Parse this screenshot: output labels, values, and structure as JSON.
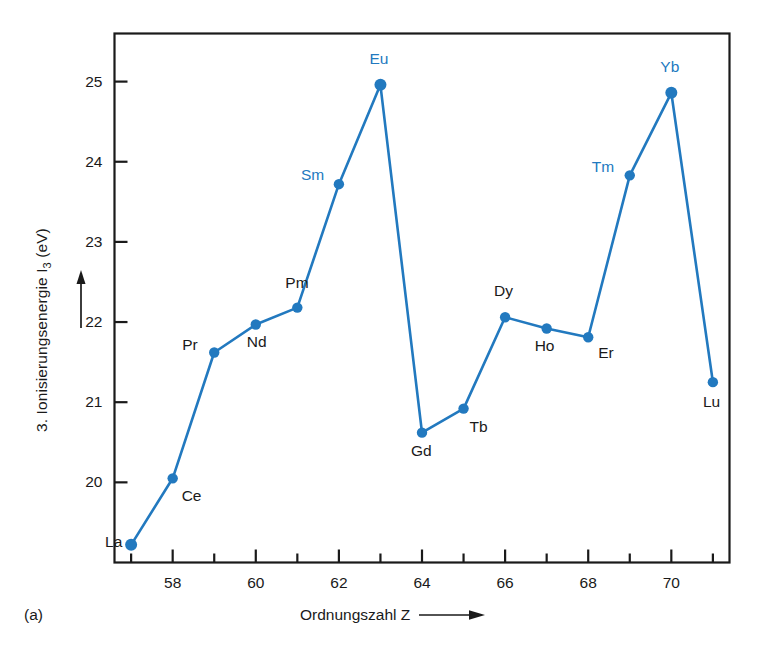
{
  "figure": {
    "panel_label": "(a)",
    "accent_color": "#2279bf",
    "axis_color": "#1a1a1a",
    "background": "#ffffff"
  },
  "axes": {
    "y_title_main": "3. Ionisierungsenergie I",
    "y_title_sub": "3",
    "y_title_unit": " (eV)",
    "y_arrow_icon": "up-arrow-icon",
    "x_title": "Ordnungszahl  Z",
    "x_arrow_icon": "right-arrow-icon",
    "y_ticks": [
      "20",
      "21",
      "22",
      "23",
      "24",
      "25"
    ],
    "x_ticks": [
      "58",
      "60",
      "62",
      "64",
      "66",
      "68",
      "70"
    ]
  },
  "chart_data": {
    "type": "line",
    "title": "",
    "subtitle": "",
    "xlabel": "Ordnungszahl Z",
    "ylabel": "3. Ionisierungsenergie I3 (eV)",
    "xlim": [
      56.6,
      71.4
    ],
    "ylim": [
      19.0,
      25.6
    ],
    "grid": false,
    "legend": "none",
    "x_major_ticks": [
      58,
      60,
      62,
      64,
      66,
      68,
      70
    ],
    "x_minor_ticks": [
      57,
      59,
      61,
      63,
      65,
      67,
      69,
      71
    ],
    "y_major_ticks": [
      20,
      21,
      22,
      23,
      24,
      25
    ],
    "marker": "filled-circle",
    "series": [
      {
        "name": "3. Ionisierungsenergie",
        "color": "#2279bf",
        "points": [
          {
            "element": "La",
            "x": 57,
            "y": 19.22,
            "label_color": "black",
            "label_dx": -26,
            "label_dy": -3
          },
          {
            "element": "Ce",
            "x": 58,
            "y": 20.05,
            "label_color": "black",
            "label_dx": 9,
            "label_dy": 18
          },
          {
            "element": "Pr",
            "x": 59,
            "y": 21.62,
            "label_color": "black",
            "label_dx": -32,
            "label_dy": -8
          },
          {
            "element": "Nd",
            "x": 60,
            "y": 21.97,
            "label_color": "black",
            "label_dx": -9,
            "label_dy": 18
          },
          {
            "element": "Pm",
            "x": 61,
            "y": 22.18,
            "label_color": "black",
            "label_dx": -12,
            "label_dy": -25
          },
          {
            "element": "Sm",
            "x": 62,
            "y": 23.72,
            "label_color": "blue",
            "label_dx": -38,
            "label_dy": -9
          },
          {
            "element": "Eu",
            "x": 63,
            "y": 24.96,
            "label_color": "blue",
            "label_dx": -11,
            "label_dy": -26
          },
          {
            "element": "Gd",
            "x": 64,
            "y": 20.62,
            "label_color": "black",
            "label_dx": -11,
            "label_dy": 18
          },
          {
            "element": "Tb",
            "x": 65,
            "y": 20.92,
            "label_color": "black",
            "label_dx": 6,
            "label_dy": 18
          },
          {
            "element": "Dy",
            "x": 66,
            "y": 22.06,
            "label_color": "black",
            "label_dx": -11,
            "label_dy": -26
          },
          {
            "element": "Ho",
            "x": 67,
            "y": 21.92,
            "label_color": "black",
            "label_dx": -12,
            "label_dy": 18
          },
          {
            "element": "Er",
            "x": 68,
            "y": 21.81,
            "label_color": "black",
            "label_dx": 10,
            "label_dy": 16
          },
          {
            "element": "Tm",
            "x": 69,
            "y": 23.83,
            "label_color": "blue",
            "label_dx": -38,
            "label_dy": -8
          },
          {
            "element": "Yb",
            "x": 70,
            "y": 24.86,
            "label_color": "blue",
            "label_dx": -11,
            "label_dy": -26
          },
          {
            "element": "Lu",
            "x": 71,
            "y": 21.25,
            "label_color": "black",
            "label_dx": -10,
            "label_dy": 20
          }
        ]
      }
    ]
  }
}
